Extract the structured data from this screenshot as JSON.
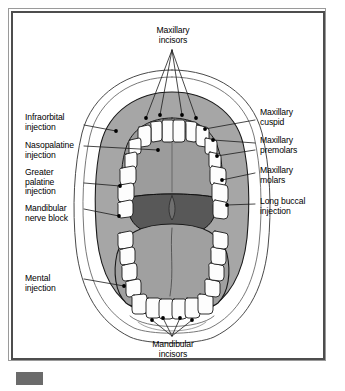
{
  "figure": {
    "type": "anatomical-diagram",
    "orientation": "frontal / inferior-superior composite view"
  },
  "labels": {
    "top": {
      "maxillary_incisors": "Maxillary\nincisors"
    },
    "left": [
      {
        "key": "infraorbital_injection",
        "text": "Infraorbital\ninjection"
      },
      {
        "key": "nasopalatine_injection",
        "text": "Nasopalatine\ninjection"
      },
      {
        "key": "greater_palatine_injection",
        "text": "Greater\npalatine\ninjection"
      },
      {
        "key": "mandibular_nerve_block",
        "text": "Mandibular\nnerve block"
      },
      {
        "key": "mental_injection",
        "text": "Mental\ninjection"
      }
    ],
    "right": [
      {
        "key": "maxillary_cuspid",
        "text": "Maxillary\ncuspid"
      },
      {
        "key": "maxillary_premolars",
        "text": "Maxillary\npremolars"
      },
      {
        "key": "maxillary_molars",
        "text": "Maxillary\nmolars"
      },
      {
        "key": "long_buccal_injection",
        "text": "Long buccal\ninjection"
      }
    ],
    "bottom": {
      "mandibular_incisors": "Mandibular\nincisors"
    }
  },
  "colors": {
    "background": "#ffffff",
    "frame_outer": "#9a9a9a",
    "frame_inner": "#4d4d4d",
    "outline": "#1a1a1a",
    "skin_white": "#ffffff",
    "mucosa_mid_grey": "#a6a6a6",
    "palate_grey": "#9c9c9c",
    "tongue_grey": "#a0a0a0",
    "oropharynx_dark": "#585858",
    "tooth_white": "#fdfdfd",
    "injection_dot": "#000000",
    "swatch": "#6b6b6b"
  },
  "markers": {
    "injection_dot_count_maxillary_anterior": 6,
    "injection_dot_count_mandibular_anterior": 4,
    "legend_swatch_present": true
  }
}
